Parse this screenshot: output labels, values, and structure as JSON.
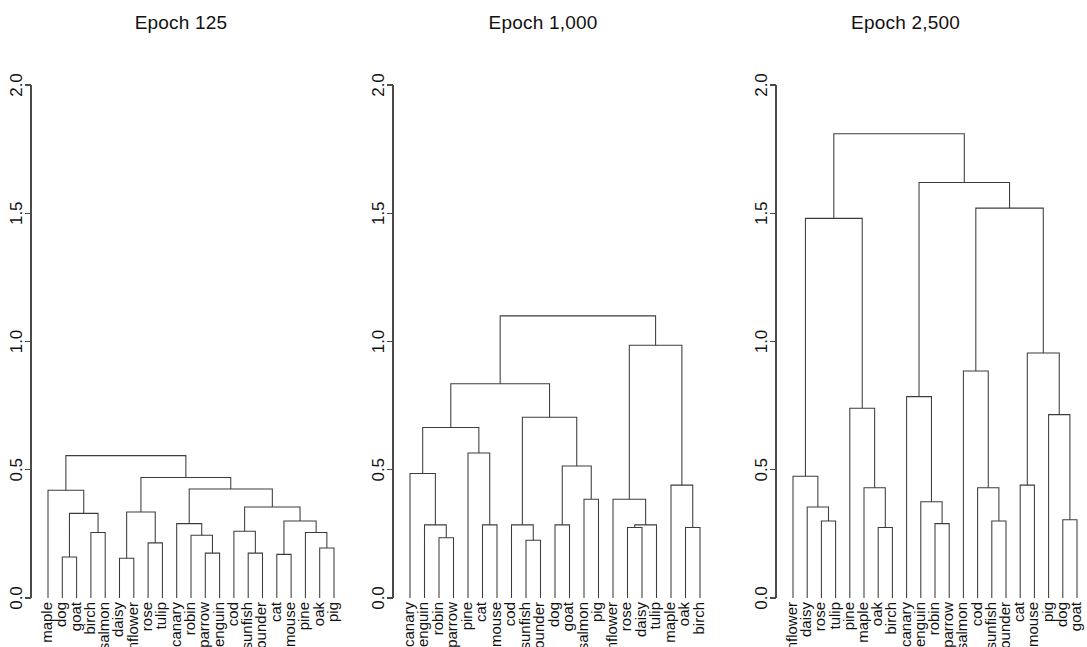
{
  "figure": {
    "background_color": "#ffffff",
    "line_color": "#3c3c3c",
    "axis_color": "#4a4a4a",
    "text_color": "#111111"
  },
  "panels": [
    {
      "title": "Epoch 125"
    },
    {
      "title": "Epoch 1,000"
    },
    {
      "title": "Epoch 2,500"
    }
  ],
  "axis": {
    "label_orientation": "rotated-90",
    "ticks": [
      "0.0",
      "0.5",
      "1.0",
      "1.5",
      "2.0"
    ],
    "tick_values": [
      0.0,
      0.5,
      1.0,
      1.5,
      2.0
    ],
    "ylim": [
      0.0,
      2.0
    ]
  },
  "chart_data": [
    {
      "type": "dendrogram",
      "title": "Epoch 125",
      "xlabel": "",
      "ylabel": "",
      "ylim": [
        0.0,
        2.0
      ],
      "yticks": [
        0.0,
        0.5,
        1.0,
        1.5,
        2.0
      ],
      "grid": false,
      "legend": "none",
      "orientation": "top-down",
      "leaves": [
        "maple",
        "dog",
        "goat",
        "birch",
        "salmon",
        "daisy",
        "sunflower",
        "rose",
        "tulip",
        "canary",
        "robin",
        "sparrow",
        "penguin",
        "cod",
        "sunfish",
        "flounder",
        "cat",
        "mouse",
        "pine",
        "oak",
        "pig"
      ],
      "merges": [
        {
          "left": "dog",
          "right": "goat",
          "height": 0.16
        },
        {
          "left": "birch",
          "right": "salmon",
          "height": 0.255
        },
        {
          "left": "[dog,goat]",
          "right": "[birch,salmon]",
          "height": 0.33
        },
        {
          "left": "maple",
          "right": "[dog,goat,birch,salmon]",
          "height": 0.42
        },
        {
          "left": "daisy",
          "right": "sunflower",
          "height": 0.155
        },
        {
          "left": "rose",
          "right": "tulip",
          "height": 0.215
        },
        {
          "left": "[daisy,sunflower]",
          "right": "[rose,tulip]",
          "height": 0.335
        },
        {
          "left": "sparrow",
          "right": "penguin",
          "height": 0.175
        },
        {
          "left": "robin",
          "right": "[sparrow,penguin]",
          "height": 0.245
        },
        {
          "left": "canary",
          "right": "[robin,sparrow,penguin]",
          "height": 0.29
        },
        {
          "left": "sunfish",
          "right": "flounder",
          "height": 0.175
        },
        {
          "left": "cod",
          "right": "[sunfish,flounder]",
          "height": 0.26
        },
        {
          "left": "cat",
          "right": "mouse",
          "height": 0.17
        },
        {
          "left": "oak",
          "right": "pig",
          "height": 0.195
        },
        {
          "left": "pine",
          "right": "[oak,pig]",
          "height": 0.255
        },
        {
          "left": "[cat,mouse]",
          "right": "[pine,oak,pig]",
          "height": 0.3
        },
        {
          "left": "[cod,sunfish,flounder]",
          "right": "[cat,mouse,pine,oak,pig]",
          "height": 0.355
        },
        {
          "left": "[canary,robin,sparrow,penguin]",
          "right": "[cod,sunfish,flounder,cat,mouse,pine,oak,pig]",
          "height": 0.425
        },
        {
          "left": "[daisy,sunflower,rose,tulip]",
          "right": "[canary,robin,sparrow,penguin,cod,sunfish,flounder,cat,mouse,pine,oak,pig]",
          "height": 0.47
        },
        {
          "left": "[maple,dog,goat,birch,salmon]",
          "right": "[daisy,sunflower,rose,tulip,canary,robin,sparrow,penguin,cod,sunfish,flounder,cat,mouse,pine,oak,pig]",
          "height": 0.555
        }
      ]
    },
    {
      "type": "dendrogram",
      "title": "Epoch 1,000",
      "xlabel": "",
      "ylabel": "",
      "ylim": [
        0.0,
        2.0
      ],
      "yticks": [
        0.0,
        0.5,
        1.0,
        1.5,
        2.0
      ],
      "grid": false,
      "legend": "none",
      "orientation": "top-down",
      "leaves": [
        "canary",
        "penguin",
        "robin",
        "sparrow",
        "pine",
        "cat",
        "mouse",
        "cod",
        "sunfish",
        "flounder",
        "dog",
        "goat",
        "salmon",
        "pig",
        "sunflower",
        "rose",
        "daisy",
        "tulip",
        "maple",
        "oak",
        "birch"
      ],
      "merges": [
        {
          "left": "robin",
          "right": "sparrow",
          "height": 0.235
        },
        {
          "left": "penguin",
          "right": "[robin,sparrow]",
          "height": 0.285
        },
        {
          "left": "canary",
          "right": "[penguin,robin,sparrow]",
          "height": 0.485
        },
        {
          "left": "cat",
          "right": "mouse",
          "height": 0.285
        },
        {
          "left": "pine",
          "right": "[cat,mouse]",
          "height": 0.565
        },
        {
          "left": "[canary,penguin,robin,sparrow]",
          "right": "[pine,cat,mouse]",
          "height": 0.665
        },
        {
          "left": "sunfish",
          "right": "flounder",
          "height": 0.225
        },
        {
          "left": "cod",
          "right": "[sunfish,flounder]",
          "height": 0.285
        },
        {
          "left": "dog",
          "right": "goat",
          "height": 0.285
        },
        {
          "left": "salmon",
          "right": "pig",
          "height": 0.385
        },
        {
          "left": "[dog,goat]",
          "right": "[salmon,pig]",
          "height": 0.515
        },
        {
          "left": "[cod,sunfish,flounder]",
          "right": "[dog,goat,salmon,pig]",
          "height": 0.705
        },
        {
          "left": "[canary,penguin,robin,sparrow,pine,cat,mouse]",
          "right": "[cod,sunfish,flounder,dog,goat,salmon,pig]",
          "height": 0.835
        },
        {
          "left": "rose",
          "right": "daisy",
          "height": 0.275
        },
        {
          "left": "[rose,daisy]",
          "right": "tulip",
          "height": 0.285
        },
        {
          "left": "sunflower",
          "right": "[rose,daisy,tulip]",
          "height": 0.385
        },
        {
          "left": "oak",
          "right": "birch",
          "height": 0.275
        },
        {
          "left": "maple",
          "right": "[oak,birch]",
          "height": 0.44
        },
        {
          "left": "[sunflower,rose,daisy,tulip]",
          "right": "[maple,oak,birch]",
          "height": 0.985
        },
        {
          "left": "[canary,penguin,robin,sparrow,pine,cat,mouse,cod,sunfish,flounder,dog,goat,salmon,pig]",
          "right": "[sunflower,rose,daisy,tulip,maple,oak,birch]",
          "height": 1.1
        }
      ]
    },
    {
      "type": "dendrogram",
      "title": "Epoch 2,500",
      "xlabel": "",
      "ylabel": "",
      "ylim": [
        0.0,
        2.0
      ],
      "yticks": [
        0.0,
        0.5,
        1.0,
        1.5,
        2.0
      ],
      "grid": false,
      "legend": "none",
      "orientation": "top-down",
      "leaves": [
        "sunflower",
        "daisy",
        "rose",
        "tulip",
        "pine",
        "maple",
        "oak",
        "birch",
        "canary",
        "penguin",
        "robin",
        "sparrow",
        "salmon",
        "cod",
        "sunfish",
        "flounder",
        "cat",
        "mouse",
        "pig",
        "dog",
        "goat"
      ],
      "merges": [
        {
          "left": "rose",
          "right": "tulip",
          "height": 0.3
        },
        {
          "left": "daisy",
          "right": "[rose,tulip]",
          "height": 0.355
        },
        {
          "left": "sunflower",
          "right": "[daisy,rose,tulip]",
          "height": 0.475
        },
        {
          "left": "oak",
          "right": "birch",
          "height": 0.275
        },
        {
          "left": "maple",
          "right": "[oak,birch]",
          "height": 0.43
        },
        {
          "left": "pine",
          "right": "[maple,oak,birch]",
          "height": 0.74
        },
        {
          "left": "[sunflower,daisy,rose,tulip]",
          "right": "[pine,maple,oak,birch]",
          "height": 1.48
        },
        {
          "left": "robin",
          "right": "sparrow",
          "height": 0.29
        },
        {
          "left": "penguin",
          "right": "[robin,sparrow]",
          "height": 0.375
        },
        {
          "left": "canary",
          "right": "[penguin,robin,sparrow]",
          "height": 0.785
        },
        {
          "left": "sunfish",
          "right": "flounder",
          "height": 0.3
        },
        {
          "left": "cod",
          "right": "[sunfish,flounder]",
          "height": 0.43
        },
        {
          "left": "salmon",
          "right": "[cod,sunfish,flounder]",
          "height": 0.885
        },
        {
          "left": "cat",
          "right": "mouse",
          "height": 0.44
        },
        {
          "left": "dog",
          "right": "goat",
          "height": 0.305
        },
        {
          "left": "pig",
          "right": "[dog,goat]",
          "height": 0.715
        },
        {
          "left": "[cat,mouse]",
          "right": "[pig,dog,goat]",
          "height": 0.955
        },
        {
          "left": "[salmon,cod,sunfish,flounder]",
          "right": "[cat,mouse,pig,dog,goat]",
          "height": 1.52
        },
        {
          "left": "[canary,penguin,robin,sparrow]",
          "right": "[salmon,cod,sunfish,flounder,cat,mouse,pig,dog,goat]",
          "height": 1.62
        },
        {
          "left": "[sunflower,daisy,rose,tulip,pine,maple,oak,birch]",
          "right": "[canary,penguin,robin,sparrow,salmon,cod,sunfish,flounder,cat,mouse,pig,dog,goat]",
          "height": 1.81
        }
      ]
    }
  ]
}
